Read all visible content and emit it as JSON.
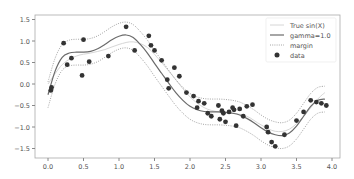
{
  "chart_data": {
    "type": "scatter",
    "title": "",
    "xlabel": "",
    "ylabel": "",
    "xlim": [
      -0.2,
      4.1
    ],
    "ylim": [
      -1.75,
      1.6
    ],
    "grid": false,
    "legend_position": "upper right",
    "x_ticks": [
      "0.0",
      "0.5",
      "1.0",
      "1.5",
      "2.0",
      "2.5",
      "3.0",
      "3.5",
      "4.0"
    ],
    "x_tick_values": [
      0.0,
      0.5,
      1.0,
      1.5,
      2.0,
      2.5,
      3.0,
      3.5,
      4.0
    ],
    "y_ticks": [
      "1.5",
      "1.0",
      "0.5",
      "0.0",
      "−0.5",
      "−1.0",
      "−1.5"
    ],
    "y_tick_values": [
      1.5,
      1.0,
      0.5,
      0.0,
      -0.5,
      -1.0,
      -1.5
    ],
    "legend": [
      {
        "label": "True sin(X)",
        "style": "thin-light-line",
        "color": "#d9d9d9"
      },
      {
        "label": "gamma=1.0",
        "style": "solid-line",
        "color": "#666666"
      },
      {
        "label": "margin",
        "style": "dotted-line",
        "color": "#999999"
      },
      {
        "label": "data",
        "style": "marker",
        "color": "#333333"
      }
    ],
    "series": [
      {
        "name": "gamma=1.0",
        "type": "line",
        "x": [
          0.0,
          0.1,
          0.2,
          0.3,
          0.4,
          0.5,
          0.6,
          0.7,
          0.8,
          0.9,
          1.0,
          1.1,
          1.2,
          1.3,
          1.4,
          1.5,
          1.6,
          1.7,
          1.8,
          1.9,
          2.0,
          2.1,
          2.2,
          2.3,
          2.4,
          2.5,
          2.6,
          2.7,
          2.8,
          2.9,
          3.0,
          3.1,
          3.2,
          3.3,
          3.4,
          3.5,
          3.6,
          3.7,
          3.8,
          3.9
        ],
        "y": [
          -0.25,
          0.3,
          0.62,
          0.72,
          0.74,
          0.74,
          0.76,
          0.82,
          0.92,
          1.03,
          1.11,
          1.14,
          1.08,
          0.92,
          0.72,
          0.48,
          0.25,
          0.02,
          -0.2,
          -0.38,
          -0.52,
          -0.6,
          -0.64,
          -0.65,
          -0.65,
          -0.66,
          -0.68,
          -0.72,
          -0.8,
          -0.9,
          -1.02,
          -1.12,
          -1.18,
          -1.2,
          -1.14,
          -0.98,
          -0.75,
          -0.52,
          -0.38,
          -0.35
        ]
      },
      {
        "name": "margin upper",
        "type": "line",
        "x": [
          0.0,
          0.1,
          0.2,
          0.3,
          0.4,
          0.5,
          0.6,
          0.7,
          0.8,
          0.9,
          1.0,
          1.1,
          1.2,
          1.3,
          1.4,
          1.5,
          1.6,
          1.7,
          1.8,
          1.9,
          2.0,
          2.1,
          2.2,
          2.3,
          2.4,
          2.5,
          2.6,
          2.7,
          2.8,
          2.9,
          3.0,
          3.1,
          3.2,
          3.3,
          3.4,
          3.5,
          3.6,
          3.7,
          3.8,
          3.9
        ],
        "y": [
          0.05,
          0.6,
          0.92,
          1.02,
          1.04,
          1.04,
          1.06,
          1.12,
          1.22,
          1.33,
          1.41,
          1.44,
          1.38,
          1.22,
          1.02,
          0.78,
          0.55,
          0.32,
          0.1,
          -0.08,
          -0.22,
          -0.3,
          -0.34,
          -0.35,
          -0.35,
          -0.36,
          -0.38,
          -0.42,
          -0.5,
          -0.6,
          -0.72,
          -0.82,
          -0.88,
          -0.9,
          -0.84,
          -0.68,
          -0.45,
          -0.22,
          -0.08,
          -0.05
        ]
      },
      {
        "name": "margin lower",
        "type": "line",
        "x": [
          0.0,
          0.1,
          0.2,
          0.3,
          0.4,
          0.5,
          0.6,
          0.7,
          0.8,
          0.9,
          1.0,
          1.1,
          1.2,
          1.3,
          1.4,
          1.5,
          1.6,
          1.7,
          1.8,
          1.9,
          2.0,
          2.1,
          2.2,
          2.3,
          2.4,
          2.5,
          2.6,
          2.7,
          2.8,
          2.9,
          3.0,
          3.1,
          3.2,
          3.3,
          3.4,
          3.5,
          3.6,
          3.7,
          3.8,
          3.9
        ],
        "y": [
          -0.55,
          0.0,
          0.32,
          0.42,
          0.44,
          0.44,
          0.46,
          0.52,
          0.62,
          0.73,
          0.81,
          0.84,
          0.78,
          0.62,
          0.42,
          0.18,
          -0.05,
          -0.28,
          -0.5,
          -0.68,
          -0.82,
          -0.9,
          -0.94,
          -0.95,
          -0.95,
          -0.96,
          -0.98,
          -1.02,
          -1.1,
          -1.2,
          -1.32,
          -1.42,
          -1.48,
          -1.5,
          -1.44,
          -1.28,
          -1.05,
          -0.82,
          -0.68,
          -0.65
        ]
      },
      {
        "name": "True sin(X)",
        "type": "line",
        "x": [
          0.0,
          0.2,
          0.4,
          0.6,
          0.8,
          1.0,
          1.2,
          1.4,
          1.6,
          1.8,
          2.0,
          2.2,
          2.4,
          2.6,
          2.8,
          3.0,
          3.2,
          3.4,
          3.6,
          3.8,
          3.9
        ],
        "y": [
          0.0,
          0.45,
          0.65,
          0.72,
          0.8,
          0.92,
          0.98,
          0.85,
          0.5,
          0.1,
          -0.3,
          -0.55,
          -0.65,
          -0.68,
          -0.75,
          -0.95,
          -1.1,
          -1.05,
          -0.75,
          -0.35,
          -0.2
        ]
      },
      {
        "name": "data",
        "type": "scatter",
        "x": [
          0.04,
          0.05,
          0.22,
          0.27,
          0.33,
          0.48,
          0.5,
          0.58,
          0.85,
          1.1,
          1.22,
          1.42,
          1.45,
          1.5,
          1.6,
          1.68,
          1.7,
          1.78,
          1.85,
          1.95,
          2.05,
          2.1,
          2.12,
          2.2,
          2.25,
          2.3,
          2.4,
          2.42,
          2.45,
          2.47,
          2.5,
          2.55,
          2.6,
          2.62,
          2.65,
          2.7,
          2.75,
          2.8,
          2.88,
          3.08,
          3.1,
          3.15,
          3.2,
          3.33,
          3.5,
          3.6,
          3.7,
          3.78,
          3.85,
          3.92
        ],
        "y": [
          -0.15,
          -0.08,
          0.95,
          0.45,
          0.6,
          0.2,
          1.03,
          0.52,
          0.65,
          1.33,
          0.78,
          1.12,
          0.9,
          0.78,
          0.55,
          0.1,
          -0.1,
          0.38,
          0.18,
          -0.2,
          -0.28,
          -0.55,
          -0.4,
          -0.45,
          -0.68,
          -0.75,
          -0.5,
          -0.82,
          -0.62,
          -0.68,
          -0.88,
          -0.65,
          -0.55,
          -0.6,
          -0.97,
          -0.58,
          -0.75,
          -0.52,
          -0.48,
          -1.0,
          -1.12,
          -1.35,
          -1.45,
          -1.18,
          -0.85,
          -0.65,
          -0.38,
          -0.42,
          -0.45,
          -0.5
        ]
      }
    ]
  },
  "axes": {
    "x_tick_labels": [
      "0.0",
      "0.5",
      "1.0",
      "1.5",
      "2.0",
      "2.5",
      "3.0",
      "3.5",
      "4.0"
    ],
    "y_tick_labels": [
      "1.5",
      "1.0",
      "0.5",
      "0.0",
      "−0.5",
      "−1.0",
      "−1.5"
    ]
  },
  "legend": {
    "items": [
      "True sin(X)",
      "gamma=1.0",
      "margin",
      "data"
    ]
  },
  "colors": {
    "fit_line": "#6b6b6b",
    "margin_line": "#9a9a9a",
    "true_line": "#d6d6d6",
    "data_point": "#333333",
    "axis": "#999999",
    "tick_text": "#555555"
  }
}
